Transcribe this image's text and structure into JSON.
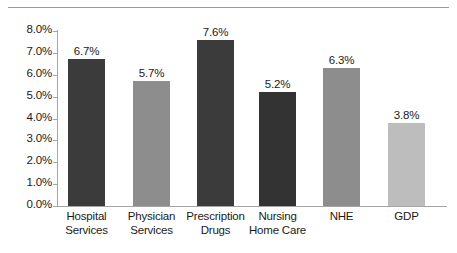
{
  "chart_data": {
    "type": "bar",
    "title": "",
    "subtitle": "",
    "xlabel": "",
    "ylabel": "",
    "categories": [
      "Hospital Services",
      "Physician Services",
      "Prescription Drugs",
      "Nursing Home Care",
      "NHE",
      "GDP"
    ],
    "category_lines": [
      [
        "Hospital",
        "Services"
      ],
      [
        "Physician",
        "Services"
      ],
      [
        "Prescription",
        "Drugs"
      ],
      [
        "Nursing",
        "Home Care"
      ],
      [
        "NHE",
        ""
      ],
      [
        "GDP",
        ""
      ]
    ],
    "values": [
      6.7,
      5.7,
      7.6,
      5.2,
      6.3,
      3.8
    ],
    "value_labels": [
      "6.7%",
      "5.7%",
      "7.6%",
      "5.2%",
      "6.3%",
      "3.8%"
    ],
    "bar_colors": [
      "#3b3b3b",
      "#8d8d8d",
      "#3b3b3b",
      "#333333",
      "#8d8d8d",
      "#bdbdbd"
    ],
    "ylim": [
      0.0,
      8.0
    ],
    "ytick_values": [
      0.0,
      1.0,
      2.0,
      3.0,
      4.0,
      5.0,
      6.0,
      7.0,
      8.0
    ],
    "ytick_labels": [
      "0.0%",
      "1.0%",
      "2.0%",
      "3.0%",
      "4.0%",
      "5.0%",
      "6.0%",
      "7.0%",
      "8.0%"
    ],
    "grid": false,
    "legend": "none",
    "axis_color": "#a5a5a5",
    "text_color": "#1a1a1a",
    "background": "#ffffff"
  }
}
